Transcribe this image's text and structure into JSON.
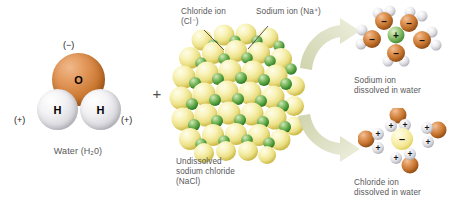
{
  "figure": {
    "background_color": "#ffffff",
    "label_color": "#58585a"
  },
  "panels": {
    "water": {
      "caption": "Water (H₂0)",
      "charge_negative": "(−)",
      "charge_positive_left": "(+)",
      "charge_positive_right": "(+)",
      "atoms": [
        {
          "symbol": "O",
          "name": "oxygen",
          "color": "#c9762f"
        },
        {
          "symbol": "H",
          "name": "hydrogen-left",
          "color": "#e4e4e8"
        },
        {
          "symbol": "H",
          "name": "hydrogen-right",
          "color": "#e4e4e8"
        }
      ]
    },
    "plus_separator": {
      "symbol": "+"
    },
    "crystal": {
      "caption_line1": "Undissolved",
      "caption_line2": "sodium chloride",
      "caption_line3": "(NaCl)",
      "callout_chloride_line1": "Chloride ion",
      "callout_chloride_line2": "(Cl⁻)",
      "callout_sodium": "Sodium ion (Na⁺)",
      "chloride_color": "#ebdf84",
      "sodium_color": "#4f9e3e"
    },
    "sodium_dissolved": {
      "caption_line1": "Sodium ion",
      "caption_line2": "dissolved in water",
      "core_sign": "+",
      "core_color": "#6fae53",
      "shell_sign": "−",
      "shell_count": 5
    },
    "chloride_dissolved": {
      "caption_line1": "Chloride ion",
      "caption_line2": "dissolved in water",
      "core_sign": "−",
      "core_color": "#f3e795",
      "shell_sign": "+",
      "shell_count": 4
    },
    "arrows": {
      "upper": "arrow-to-sodium",
      "lower": "arrow-to-chloride",
      "color": "#d9dcbc"
    }
  }
}
